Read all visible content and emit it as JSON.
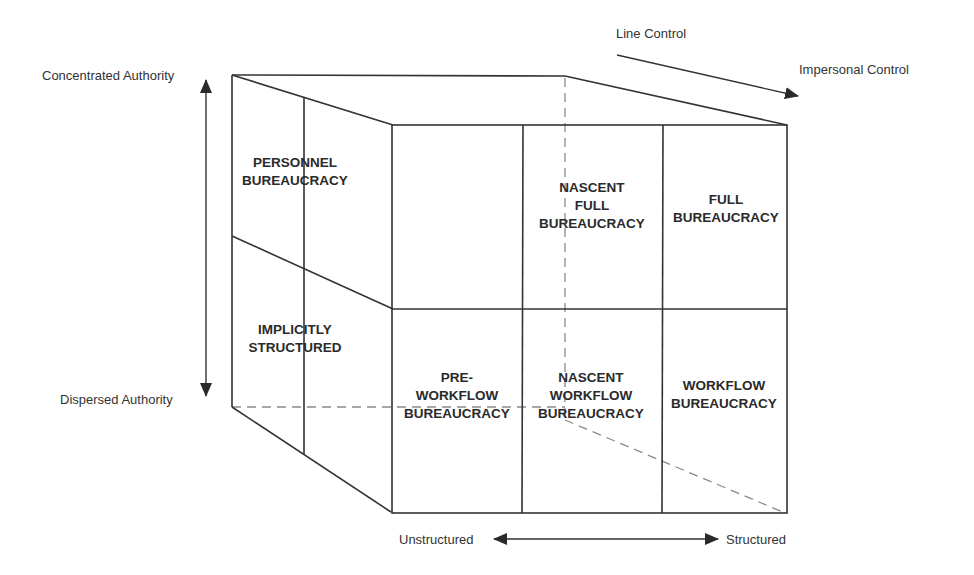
{
  "axes": {
    "vertical": {
      "top": "Concentrated Authority",
      "bottom": "Dispersed Authority"
    },
    "depth": {
      "start": "Line Control",
      "end": "Impersonal Control"
    },
    "horizontal": {
      "left": "Unstructured",
      "right": "Structured"
    }
  },
  "cells": {
    "personnel": [
      "PERSONNEL",
      "BUREAUCRACY"
    ],
    "implicitly": [
      "IMPLICITLY",
      "STRUCTURED"
    ],
    "nascent_full": [
      "NASCENT",
      "FULL",
      "BUREAUCRACY"
    ],
    "full": [
      "FULL",
      "BUREAUCRACY"
    ],
    "pre_workflow": [
      "PRE-",
      "WORKFLOW",
      "BUREAUCRACY"
    ],
    "nascent_workflow": [
      "NASCENT",
      "WORKFLOW",
      "BUREAUCRACY"
    ],
    "workflow": [
      "WORKFLOW",
      "BUREAUCRACY"
    ]
  },
  "colors": {
    "line": "#333333",
    "dashed": "#8a8a8a",
    "text": "#2a2a2a"
  }
}
